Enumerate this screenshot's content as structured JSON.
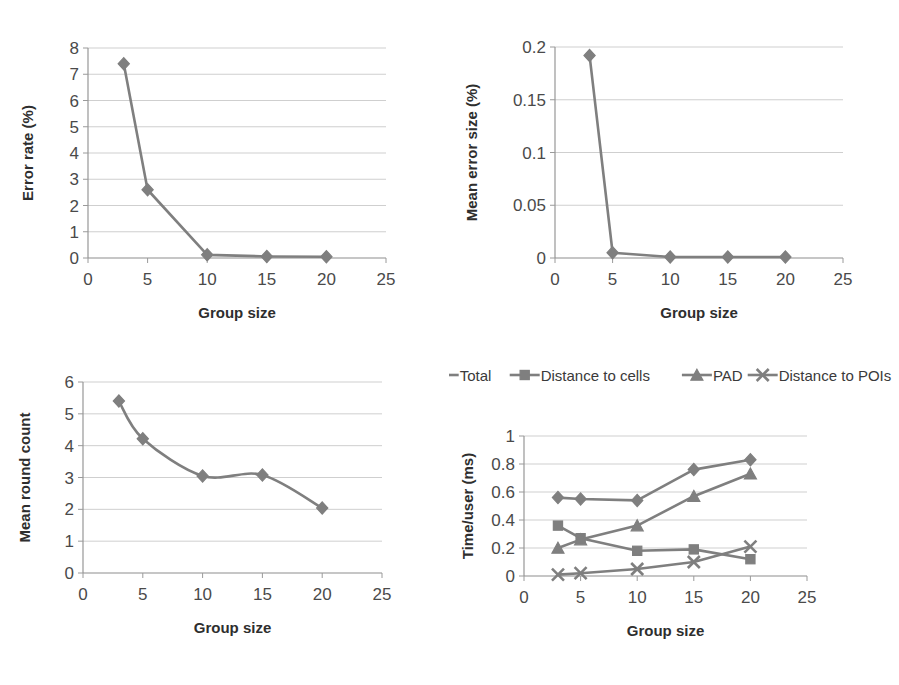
{
  "figure": {
    "background": "#ffffff",
    "series_color": "#7f7f7f",
    "grid_color": "#c9c9c9",
    "axis_color": "#8d8d8d"
  },
  "panels": {
    "error_rate": {
      "name": "Error rate vs group size",
      "xlabel": "Group size",
      "ylabel": "Error rate (%)",
      "xticks": [
        "0",
        "5",
        "10",
        "15",
        "20",
        "25"
      ],
      "yticks": [
        "0",
        "1",
        "2",
        "3",
        "4",
        "5",
        "6",
        "7",
        "8"
      ]
    },
    "error_size": {
      "name": "Mean error size vs group size",
      "xlabel": "Group size",
      "ylabel": "Mean error size (%)",
      "xticks": [
        "0",
        "5",
        "10",
        "15",
        "20",
        "25"
      ],
      "yticks": [
        "0",
        "0.05",
        "0.1",
        "0.15",
        "0.2"
      ]
    },
    "round_count": {
      "name": "Mean round count vs group size",
      "xlabel": "Group size",
      "ylabel": "Mean round count",
      "xticks": [
        "0",
        "5",
        "10",
        "15",
        "20",
        "25"
      ],
      "yticks": [
        "0",
        "1",
        "2",
        "3",
        "4",
        "5",
        "6"
      ]
    },
    "time_user": {
      "name": "Time per user vs group size",
      "xlabel": "Group size",
      "ylabel": "Time/user (ms)",
      "xticks": [
        "0",
        "5",
        "10",
        "15",
        "20",
        "25"
      ],
      "yticks": [
        "0",
        "0.2",
        "0.4",
        "0.6",
        "0.8",
        "1"
      ],
      "legend": [
        {
          "label": "Total",
          "marker": "diamond"
        },
        {
          "label": "Distance to cells",
          "marker": "square"
        },
        {
          "label": "PAD",
          "marker": "triangle"
        },
        {
          "label": "Distance to POIs",
          "marker": "x"
        }
      ]
    }
  },
  "chart_data": [
    {
      "id": "error_rate",
      "type": "line",
      "title": "",
      "xlabel": "Group size",
      "ylabel": "Error rate (%)",
      "x": [
        3,
        5,
        10,
        15,
        20
      ],
      "values": [
        7.4,
        2.6,
        0.12,
        0.06,
        0.05
      ],
      "xlim": [
        0,
        25
      ],
      "ylim": [
        0,
        8
      ],
      "xticks": [
        0,
        5,
        10,
        15,
        20,
        25
      ],
      "yticks": [
        0,
        1,
        2,
        3,
        4,
        5,
        6,
        7,
        8
      ],
      "grid": true,
      "legend": "none",
      "marker": "diamond",
      "smooth": false
    },
    {
      "id": "error_size",
      "type": "line",
      "title": "",
      "xlabel": "Group size",
      "ylabel": "Mean error size (%)",
      "x": [
        3,
        5,
        10,
        15,
        20
      ],
      "values": [
        0.192,
        0.005,
        0.001,
        0.001,
        0.001
      ],
      "xlim": [
        0,
        25
      ],
      "ylim": [
        0,
        0.2
      ],
      "xticks": [
        0,
        5,
        10,
        15,
        20,
        25
      ],
      "yticks": [
        0,
        0.05,
        0.1,
        0.15,
        0.2
      ],
      "grid": true,
      "legend": "none",
      "marker": "diamond",
      "smooth": false
    },
    {
      "id": "round_count",
      "type": "line",
      "title": "",
      "xlabel": "Group size",
      "ylabel": "Mean round count",
      "x": [
        3,
        5,
        10,
        15,
        20
      ],
      "values": [
        5.4,
        4.22,
        3.05,
        3.08,
        2.04
      ],
      "xlim": [
        0,
        25
      ],
      "ylim": [
        0,
        6
      ],
      "xticks": [
        0,
        5,
        10,
        15,
        20,
        25
      ],
      "yticks": [
        0,
        1,
        2,
        3,
        4,
        5,
        6
      ],
      "grid": true,
      "legend": "none",
      "marker": "diamond",
      "smooth": true
    },
    {
      "id": "time_user",
      "type": "line",
      "title": "",
      "xlabel": "Group size",
      "ylabel": "Time/user (ms)",
      "x": [
        3,
        5,
        10,
        15,
        20
      ],
      "xlim": [
        0,
        25
      ],
      "ylim": [
        0,
        1
      ],
      "xticks": [
        0,
        5,
        10,
        15,
        20,
        25
      ],
      "yticks": [
        0,
        0.2,
        0.4,
        0.6,
        0.8,
        1
      ],
      "grid": true,
      "legend": "top",
      "smooth": false,
      "series": [
        {
          "name": "Total",
          "marker": "diamond",
          "values": [
            0.56,
            0.55,
            0.54,
            0.76,
            0.83
          ]
        },
        {
          "name": "Distance to cells",
          "marker": "square",
          "values": [
            0.36,
            0.27,
            0.18,
            0.19,
            0.12
          ]
        },
        {
          "name": "PAD",
          "marker": "triangle",
          "values": [
            0.2,
            0.26,
            0.36,
            0.57,
            0.73
          ]
        },
        {
          "name": "Distance to POIs",
          "marker": "x",
          "values": [
            0.01,
            0.02,
            0.05,
            0.1,
            0.21
          ]
        }
      ]
    }
  ]
}
